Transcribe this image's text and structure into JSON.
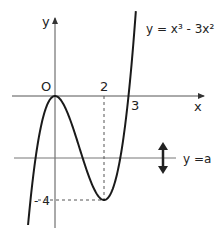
{
  "chart_data": {
    "type": "line",
    "title": "",
    "function_label": "y = x³ - 3x²",
    "xlabel": "x",
    "ylabel": "y",
    "origin_label": "O",
    "x_ticks": [
      "2",
      "3"
    ],
    "y_ticks": [
      "-4"
    ],
    "horizontal_line_label": "y =a",
    "key_points": [
      {
        "x": 0,
        "y": 0,
        "note": "local maximum"
      },
      {
        "x": 2,
        "y": -4,
        "note": "local minimum"
      },
      {
        "x": 3,
        "y": 0,
        "note": "x-intercept"
      }
    ],
    "xlim": [
      -1.1,
      3.3
    ],
    "ylim": [
      -5,
      3.3
    ],
    "grid": false
  },
  "labels": {
    "y_axis": "y",
    "x_axis": "x",
    "origin": "O",
    "tick_2": "2",
    "tick_3": "3",
    "tick_neg4": "- 4",
    "equation": "y = x³ - 3x²",
    "line_a": "y =a"
  },
  "colors": {
    "curve": "#1a1a1a",
    "axes": "#555555",
    "dashed": "#555555"
  }
}
